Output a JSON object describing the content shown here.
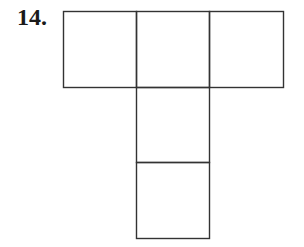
{
  "problem": {
    "number_label": "14."
  },
  "figure": {
    "stroke_color": "#333333",
    "squares": [
      {
        "x": 63,
        "y": 11,
        "w": 73,
        "h": 76
      },
      {
        "x": 136,
        "y": 11,
        "w": 73,
        "h": 76
      },
      {
        "x": 209,
        "y": 11,
        "w": 74,
        "h": 76
      },
      {
        "x": 136,
        "y": 87,
        "w": 73,
        "h": 75
      },
      {
        "x": 136,
        "y": 162,
        "w": 73,
        "h": 76
      }
    ]
  }
}
